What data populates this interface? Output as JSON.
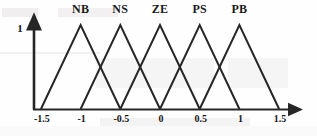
{
  "figure": {
    "width": 317,
    "height": 136,
    "background_color": "#fefefe",
    "line_color": "#262626",
    "text_color": "#161616"
  },
  "axes": {
    "y_axis_label": "1",
    "x_tick_labels": [
      "-1.5",
      "-1",
      "-0.5",
      "0",
      "0.5",
      "1",
      "1.5"
    ],
    "x_tick_values": [
      -1.5,
      -1,
      -0.5,
      0,
      0.5,
      1,
      1.5
    ],
    "origin_px": {
      "x": 33,
      "y": 109
    },
    "x_axis_arrow_end_px": 305,
    "y_axis_arrow_top_px": 10,
    "peak_y_px": 25
  },
  "chart_data": {
    "type": "line",
    "title": "",
    "subtitle": "",
    "xlabel": "",
    "ylabel": "",
    "xlim": [
      -1.6,
      1.65
    ],
    "ylim": [
      0,
      1.15
    ],
    "grid": false,
    "legend_position": "above-peaks",
    "x_ticks": [
      -1.5,
      -1,
      -0.5,
      0,
      0.5,
      1,
      1.5
    ],
    "x_tick_labels": [
      "-1.5",
      "-1",
      "-0.5",
      "0",
      "0.5",
      "1",
      "1.5"
    ],
    "y_ticks": [
      1
    ],
    "y_tick_labels": [
      "1"
    ],
    "series": [
      {
        "name": "NB",
        "label": "NB",
        "shape": "triangle",
        "params": {
          "left": -1.5,
          "peak": -1.0,
          "right": -0.5
        },
        "x": [
          -1.5,
          -1.0,
          -0.5
        ],
        "values": [
          0,
          1,
          0
        ],
        "label_x": -1.0
      },
      {
        "name": "NS",
        "label": "NS",
        "shape": "triangle",
        "params": {
          "left": -1.0,
          "peak": -0.5,
          "right": 0.0
        },
        "x": [
          -1.0,
          -0.5,
          0.0
        ],
        "values": [
          0,
          1,
          0
        ],
        "label_x": -0.5
      },
      {
        "name": "ZE",
        "label": "ZE",
        "shape": "triangle",
        "params": {
          "left": -0.5,
          "peak": 0.0,
          "right": 0.5
        },
        "x": [
          -0.5,
          0.0,
          0.5
        ],
        "values": [
          0,
          1,
          0
        ],
        "label_x": 0.0
      },
      {
        "name": "PS",
        "label": "PS",
        "shape": "triangle",
        "params": {
          "left": 0.0,
          "peak": 0.5,
          "right": 1.0
        },
        "x": [
          0.0,
          0.5,
          1.0
        ],
        "values": [
          0,
          1,
          0
        ],
        "label_x": 0.5
      },
      {
        "name": "PB",
        "label": "PB",
        "shape": "triangle",
        "params": {
          "left": 0.5,
          "peak": 1.0,
          "right": 1.5
        },
        "x": [
          0.5,
          1.0,
          1.5
        ],
        "values": [
          0,
          1,
          0
        ],
        "label_x": 1.0
      }
    ]
  }
}
